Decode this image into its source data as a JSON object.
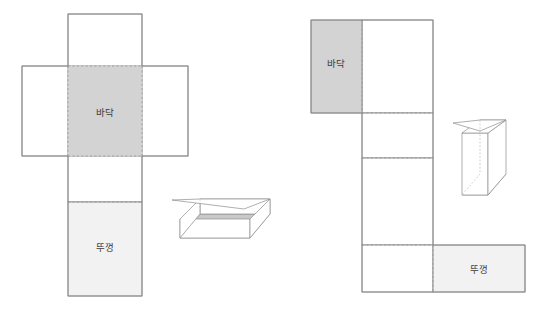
{
  "figure": {
    "title": "",
    "background_color": "#ffffff",
    "stroke_color": "#8c8c8c",
    "fold_line_color": "#a8a8a8",
    "bottom_fill_color": "#d3d3d3",
    "lid_fill_color": "#f2f2f2",
    "panel_fill_color": "#ffffff",
    "label_color": "#3a3a3a"
  },
  "nets": [
    {
      "id": "flat-box-net",
      "name": "flat-wide-box-net",
      "bottom_label": "바닥",
      "lid_label": "뚜껑",
      "bottom_panel": {
        "x": 68,
        "y": 66,
        "w": 74,
        "h": 90,
        "fill": "#d3d3d3"
      },
      "top_flap": {
        "x": 68,
        "y": 14,
        "w": 74,
        "h": 52,
        "fill": "#ffffff"
      },
      "left_flap": {
        "x": 22,
        "y": 66,
        "w": 46,
        "h": 90,
        "fill": "#ffffff"
      },
      "right_flap": {
        "x": 142,
        "y": 66,
        "w": 46,
        "h": 90,
        "fill": "#ffffff"
      },
      "side_panel": {
        "x": 68,
        "y": 156,
        "w": 74,
        "h": 46,
        "fill": "#ffffff"
      },
      "lid_panel": {
        "x": 68,
        "y": 202,
        "w": 74,
        "h": 94,
        "fill": "#f2f2f2"
      },
      "bottom_label_pos": {
        "x": 105,
        "y": 113
      },
      "lid_label_pos": {
        "x": 105,
        "y": 248
      }
    },
    {
      "id": "tall-box-net",
      "name": "tall-narrow-box-net",
      "bottom_label": "바닥",
      "lid_label": "뚜껑",
      "bottom_panel": {
        "x": 311,
        "y": 20,
        "w": 51,
        "h": 93,
        "fill": "#d3d3d3"
      },
      "top_right_panel": {
        "x": 362,
        "y": 20,
        "w": 71,
        "h": 93,
        "fill": "#ffffff"
      },
      "mid_panel_1": {
        "x": 362,
        "y": 113,
        "w": 71,
        "h": 45,
        "fill": "#ffffff"
      },
      "mid_panel_2": {
        "x": 362,
        "y": 158,
        "w": 71,
        "h": 87,
        "fill": "#ffffff"
      },
      "mid_panel_3": {
        "x": 362,
        "y": 245,
        "w": 71,
        "h": 47,
        "fill": "#ffffff"
      },
      "lid_panel": {
        "x": 433,
        "y": 245,
        "w": 92,
        "h": 47,
        "fill": "#f2f2f2"
      },
      "bottom_label_pos": {
        "x": 336,
        "y": 64
      },
      "lid_label_pos": {
        "x": 479,
        "y": 270
      }
    }
  ],
  "box_illustrations": [
    {
      "id": "flat-box-3d",
      "name": "flat-open-box-isometric",
      "orientation": "flat-wide",
      "shading_color": "#c9c9c9",
      "stroke_color": "#8c8c8c"
    },
    {
      "id": "tall-box-3d",
      "name": "tall-open-box-isometric",
      "orientation": "tall-narrow",
      "shading_color": "#c9c9c9",
      "stroke_color": "#8c8c8c"
    }
  ],
  "labels": {
    "bottom": "바닥",
    "lid": "뚜껑"
  }
}
